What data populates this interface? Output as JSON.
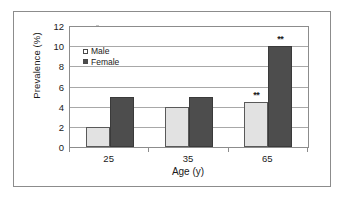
{
  "chart_data": {
    "type": "bar",
    "title": "",
    "xlabel": "Age (y)",
    "ylabel": "Prevalence (%)",
    "categories": [
      "25",
      "35",
      "65"
    ],
    "series": [
      {
        "name": "Male",
        "values": [
          2,
          4,
          4.5
        ],
        "color": "#e2e2e2",
        "annotations": [
          "",
          "",
          "**"
        ]
      },
      {
        "name": "Female",
        "values": [
          5,
          5,
          10
        ],
        "color": "#4d4d4d",
        "annotations": [
          "",
          "",
          "**"
        ]
      }
    ],
    "ylim": [
      0,
      12
    ],
    "yticks": [
      "0",
      "2",
      "4",
      "6",
      "8",
      "10",
      "12"
    ],
    "grid": "horizontal",
    "legend_position": "top-left-inside",
    "significance_marker": "**"
  },
  "legend": {
    "items": [
      {
        "label": "Male"
      },
      {
        "label": "Female"
      }
    ]
  },
  "axes": {
    "y_title": "Prevalence (%)",
    "x_title": "Age (y)"
  }
}
